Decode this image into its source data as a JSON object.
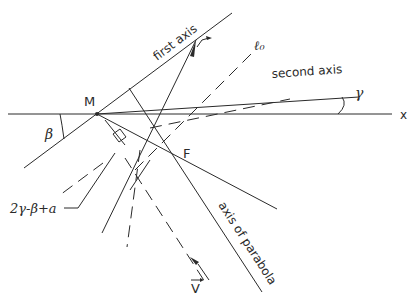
{
  "diagram": {
    "labels": {
      "point_M": "M",
      "point_F": "F",
      "x_axis": "x",
      "first_axis": "first axis",
      "second_axis": "second axis",
      "axis_of_parabola": "axis of parabola",
      "line_l0": "ℓ₀",
      "angle_beta": "β",
      "angle_gamma": "γ",
      "angle_expression": "2γ-β+a",
      "vector_V": "V"
    },
    "colors": {
      "ink": "#2a2a2a",
      "background": "#ffffff"
    }
  }
}
